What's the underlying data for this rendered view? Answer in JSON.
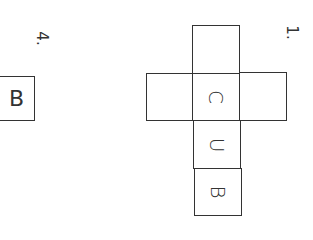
{
  "labels": {
    "problem_1": "1.",
    "problem_4": "4."
  },
  "net_1": {
    "cells": [
      {
        "position": "top",
        "letter": ""
      },
      {
        "position": "middle-left",
        "letter": ""
      },
      {
        "position": "center",
        "letter": "C"
      },
      {
        "position": "middle-right",
        "letter": ""
      },
      {
        "position": "below-center",
        "letter": "U"
      },
      {
        "position": "bottom",
        "letter": "B"
      }
    ]
  },
  "answer_box_4": {
    "letter": "B"
  }
}
